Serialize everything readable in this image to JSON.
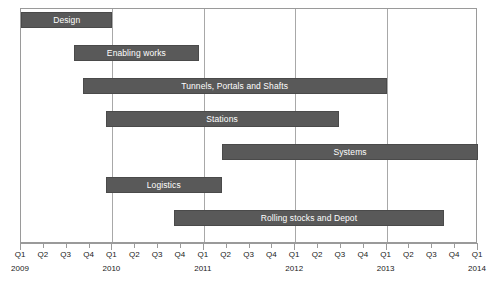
{
  "chart_data": {
    "type": "bar",
    "chart_subtype": "gantt",
    "title": "",
    "xlabel": "",
    "ylabel": "",
    "grid": "vertical gridlines at each year start (Q1)",
    "legend": "none",
    "axis_start": "Q1 2009",
    "axis_end": "Q1 2014",
    "quarter_ticks": [
      "Q1",
      "Q2",
      "Q3",
      "Q4",
      "Q1",
      "Q2",
      "Q3",
      "Q4",
      "Q1",
      "Q2",
      "Q3",
      "Q4",
      "Q1",
      "Q2",
      "Q3",
      "Q4",
      "Q1",
      "Q2",
      "Q3",
      "Q4",
      "Q1"
    ],
    "year_labels": [
      {
        "year": "2009",
        "tick_index": 0
      },
      {
        "year": "2010",
        "tick_index": 4
      },
      {
        "year": "2011",
        "tick_index": 8
      },
      {
        "year": "2012",
        "tick_index": 12
      },
      {
        "year": "2013",
        "tick_index": 16
      },
      {
        "year": "2014",
        "tick_index": 20
      }
    ],
    "gridline_tick_indices": [
      4,
      8,
      12,
      16
    ],
    "bar_color": "#595959",
    "bar_text_color": "#ffffff",
    "tasks": [
      {
        "name": "Design",
        "start_quarter": 0,
        "end_quarter": 4,
        "start_label": "Q1 2009",
        "end_label": "Q1 2010"
      },
      {
        "name": "Enabling works",
        "start_quarter": 2.3,
        "end_quarter": 7.8,
        "start_label": "Q3 2009",
        "end_label": "Q4 2010"
      },
      {
        "name": "Tunnels, Portals and Shafts",
        "start_quarter": 2.7,
        "end_quarter": 16.0,
        "start_label": "Q4 2009",
        "end_label": "Q1 2013"
      },
      {
        "name": "Stations",
        "start_quarter": 3.7,
        "end_quarter": 13.9,
        "start_label": "Q1 2010",
        "end_label": "Q2 2012"
      },
      {
        "name": "Systems",
        "start_quarter": 8.8,
        "end_quarter": 20.0,
        "start_label": "Q1 2011",
        "end_label": "Q1 2014"
      },
      {
        "name": "Logistics",
        "start_quarter": 3.7,
        "end_quarter": 8.8,
        "start_label": "Q1 2010",
        "end_label": "Q1 2011"
      },
      {
        "name": "Rolling stocks and Depot",
        "start_quarter": 6.7,
        "end_quarter": 18.5,
        "start_label": "Q4 2010",
        "end_label": "Q3 2013"
      }
    ]
  },
  "caption": ""
}
